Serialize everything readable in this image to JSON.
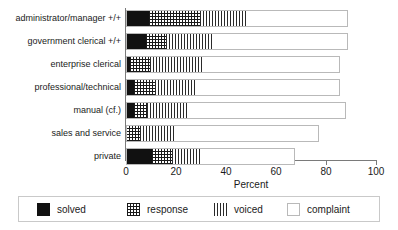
{
  "chart_data": {
    "type": "bar",
    "orientation": "horizontal",
    "stacked": true,
    "title": "",
    "xlabel": "Percent",
    "ylabel": "",
    "xlim": [
      0,
      100
    ],
    "xticks": [
      0,
      20,
      40,
      60,
      80,
      100
    ],
    "xtick_labels": [
      "0",
      "20",
      "40",
      "60",
      "80",
      "100"
    ],
    "grid": false,
    "legend_position": "bottom",
    "categories": [
      "administrator/manager +/+",
      "government clerical +/+",
      "enterprise clerical",
      "professional/technical",
      "manual (cf.)",
      "sales and service",
      "private"
    ],
    "series": [
      {
        "name": "solved",
        "values": [
          9.0,
          8.0,
          1.6,
          3.0,
          3.2,
          0.0,
          10.4
        ]
      },
      {
        "name": "response",
        "values": [
          20.4,
          8.0,
          8.0,
          8.4,
          5.2,
          5.6,
          8.0
        ]
      },
      {
        "name": "voiced",
        "values": [
          19.2,
          18.4,
          21.6,
          17.0,
          16.4,
          14.0,
          11.2
        ]
      },
      {
        "name": "complaint",
        "values": [
          40.2,
          54.4,
          54.4,
          57.2,
          63.2,
          57.6,
          38.0
        ]
      }
    ],
    "totals": [
      88.8,
      88.8,
      85.6,
      85.6,
      88.0,
      77.2,
      67.6
    ]
  },
  "axis": {
    "x_title": "Percent"
  },
  "legend": {
    "items": [
      {
        "label": "solved",
        "pattern": "solid-black"
      },
      {
        "label": "response",
        "pattern": "crosshatch-grid"
      },
      {
        "label": "voiced",
        "pattern": "vertical-lines"
      },
      {
        "label": "complaint",
        "pattern": "empty-white"
      }
    ]
  },
  "colors": {
    "solved": "#111111",
    "hatch": "#1a1a1a",
    "axis": "#7a7a7a",
    "bar_outline": "#b9b9b9",
    "background": "#ffffff",
    "text": "#1a1a1a"
  }
}
